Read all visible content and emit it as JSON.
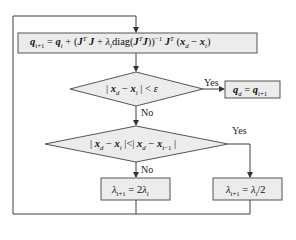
{
  "diagram": {
    "type": "flowchart",
    "colors": {
      "line": "#404040",
      "box_fill": "#ececec",
      "box_stroke": "#555555"
    },
    "nodes": [
      {
        "id": "update",
        "shape": "rect",
        "text": "q_{i+1} = q_i + (J^T J + λ_i diag(J^T J))^{-1} J^T (x_d − x_i)"
      },
      {
        "id": "check1",
        "shape": "diamond",
        "text": "|x_d − x_i| < ε"
      },
      {
        "id": "done",
        "shape": "rect",
        "text": "q_d = q_{i+1}"
      },
      {
        "id": "check2",
        "shape": "diamond",
        "text": "|x_d − x_i| < |x_d − x_{i−1}|"
      },
      {
        "id": "increase",
        "shape": "rect",
        "text": "λ_{i+1} = 2λ_i"
      },
      {
        "id": "decrease",
        "shape": "rect",
        "text": "λ_{i+1} = λ_i/2"
      }
    ],
    "edges": [
      {
        "from": "update",
        "to": "check1",
        "label": ""
      },
      {
        "from": "check1",
        "to": "done",
        "label": "Yes"
      },
      {
        "from": "check1",
        "to": "check2",
        "label": "No"
      },
      {
        "from": "check2",
        "to": "increase",
        "label": "No"
      },
      {
        "from": "check2",
        "to": "decrease",
        "label": "Yes"
      },
      {
        "from": "increase",
        "to": "update",
        "label": ""
      },
      {
        "from": "decrease",
        "to": "update",
        "label": ""
      }
    ],
    "labels": {
      "yes1": "Yes",
      "no1": "No",
      "yes2": "Yes",
      "no2": "No"
    },
    "math": {
      "q": "q",
      "i1": "i+1",
      "i": "i",
      "J": "J",
      "T": "T",
      "lambda": "λ",
      "diag": "diag",
      "inv": "−1",
      "x": "x",
      "d": "d",
      "eps": "ε",
      "im1": "i−1",
      "two": "2",
      "half": "/2"
    }
  }
}
